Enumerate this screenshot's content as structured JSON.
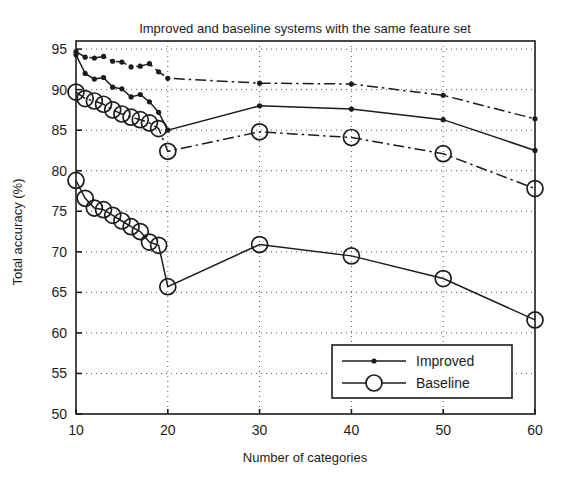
{
  "chart_data": {
    "type": "line",
    "title": "Improved and baseline systems with the same feature set",
    "xlabel": "Number of categories",
    "ylabel": "Total accuracy (%)",
    "xlim": [
      10,
      60
    ],
    "ylim": [
      50,
      96
    ],
    "xticks": [
      10,
      20,
      30,
      40,
      50,
      60
    ],
    "xtick_labels": [
      "10",
      "20",
      "30",
      "40",
      "50",
      "60"
    ],
    "yticks": [
      50,
      55,
      60,
      65,
      70,
      75,
      80,
      85,
      90,
      95
    ],
    "ytick_labels": [
      "50",
      "55",
      "60",
      "65",
      "70",
      "75",
      "80",
      "85",
      "90",
      "95"
    ],
    "grid": "dotted",
    "legend_position": "lower-right",
    "legend": [
      {
        "label": "Improved",
        "marker": "small-filled-dot",
        "line": "solid"
      },
      {
        "label": "Baseline",
        "marker": "large-open-circle",
        "line": "solid"
      }
    ],
    "series": [
      {
        "name": "Improved (upper group)",
        "marker": "small-filled-dot",
        "line": "dash-dot",
        "x": [
          10,
          11,
          12,
          13,
          14,
          15,
          16,
          17,
          18,
          19,
          20,
          30,
          40,
          50,
          60
        ],
        "y": [
          94.7,
          94.0,
          93.9,
          94.1,
          93.5,
          93.4,
          92.8,
          92.9,
          93.2,
          92.2,
          91.4,
          90.8,
          90.7,
          89.3,
          86.4
        ]
      },
      {
        "name": "Improved (lower group)",
        "marker": "small-filled-dot",
        "line": "solid",
        "x": [
          10,
          11,
          12,
          13,
          14,
          15,
          16,
          17,
          18,
          19,
          20,
          30,
          40,
          50,
          60
        ],
        "y": [
          94.3,
          92.0,
          91.3,
          91.5,
          90.3,
          90.1,
          89.1,
          89.4,
          88.5,
          87.2,
          85.0,
          88.0,
          87.6,
          86.3,
          82.5
        ]
      },
      {
        "name": "Baseline (upper group)",
        "marker": "large-open-circle",
        "line": "dash-dot",
        "x": [
          10,
          11,
          12,
          13,
          14,
          15,
          16,
          17,
          18,
          19,
          20,
          30,
          40,
          50,
          60
        ],
        "y": [
          89.7,
          88.9,
          88.6,
          88.2,
          87.5,
          87.0,
          86.6,
          86.3,
          85.9,
          85.2,
          82.4,
          84.8,
          84.1,
          82.1,
          77.8
        ]
      },
      {
        "name": "Baseline (lower group)",
        "marker": "large-open-circle",
        "line": "solid",
        "x": [
          10,
          11,
          12,
          13,
          14,
          15,
          16,
          17,
          18,
          19,
          20,
          30,
          40,
          50,
          60
        ],
        "y": [
          78.8,
          76.6,
          75.4,
          75.2,
          74.5,
          73.8,
          73.1,
          72.5,
          71.2,
          70.8,
          65.7,
          70.9,
          69.5,
          66.7,
          61.6
        ]
      }
    ]
  },
  "colors": {
    "axis": "#1c1c1c",
    "line": "#1c1c1c",
    "grid": "#555555",
    "background": "#ffffff"
  }
}
